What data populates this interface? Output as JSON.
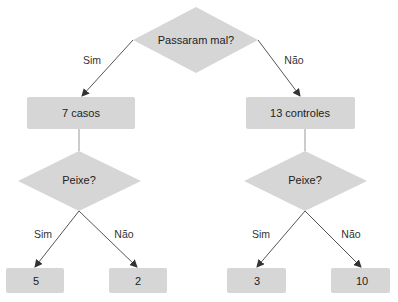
{
  "diagram": {
    "type": "decision-tree",
    "colors": {
      "node_fill": "#d6d6d6",
      "edge": "#444444",
      "text": "#222222"
    },
    "root": {
      "label": "Passaram mal?"
    },
    "root_edges": {
      "left": "Sim",
      "right": "Não"
    },
    "level1": [
      {
        "label": "7 casos"
      },
      {
        "label": "13 controles"
      }
    ],
    "level2": [
      {
        "label": "Peixe?",
        "edges": {
          "left": "Sim",
          "right": "Não"
        }
      },
      {
        "label": "Peixe?",
        "edges": {
          "left": "Sim",
          "right": "Não"
        }
      }
    ],
    "leaves": [
      {
        "label": "5"
      },
      {
        "label": "2"
      },
      {
        "label": "3"
      },
      {
        "label": "10"
      }
    ]
  }
}
